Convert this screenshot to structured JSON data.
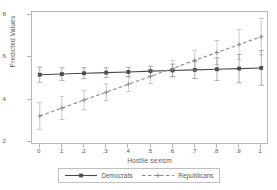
{
  "chart_data": {
    "type": "line",
    "title": "",
    "xlabel": "Hostile sexism",
    "ylabel": "Predicted Values",
    "x": [
      0,
      0.1,
      0.2,
      0.3,
      0.4,
      0.5,
      0.6,
      0.7,
      0.8,
      0.9,
      1
    ],
    "xtick_labels": [
      "0",
      ".1",
      ".2",
      ".3",
      ".4",
      ".5",
      ".6",
      ".7",
      ".8",
      ".9",
      "1"
    ],
    "ytick_labels": [
      "8",
      "6",
      "4",
      "2"
    ],
    "yticks": [
      8,
      6,
      4,
      2
    ],
    "xlim": [
      -0.035,
      1.035
    ],
    "ylim": [
      1.85,
      8.15
    ],
    "grid": false,
    "legend_position": "bottom",
    "error_bars": "95% confidence interval",
    "series": [
      {
        "name": "Democrats",
        "color": "#4a4a4a",
        "linestyle": "solid",
        "marker": "filled-square",
        "values": [
          5.18,
          5.21,
          5.25,
          5.28,
          5.31,
          5.35,
          5.38,
          5.41,
          5.44,
          5.47,
          5.5
        ],
        "ci_lower": [
          4.82,
          4.91,
          4.99,
          5.05,
          5.1,
          5.12,
          5.08,
          5.0,
          4.9,
          4.8,
          4.68
        ],
        "ci_upper": [
          5.54,
          5.51,
          5.51,
          5.51,
          5.52,
          5.58,
          5.68,
          5.82,
          5.98,
          6.14,
          6.32
        ]
      },
      {
        "name": "Republicans",
        "color": "#8a8a8a",
        "linestyle": "dashed",
        "marker": "cross",
        "values": [
          3.22,
          3.6,
          3.98,
          4.35,
          4.73,
          5.1,
          5.48,
          5.86,
          6.23,
          6.61,
          6.98
        ],
        "ci_lower": [
          2.58,
          3.06,
          3.52,
          3.96,
          4.38,
          4.76,
          5.1,
          5.4,
          5.66,
          5.9,
          6.12
        ],
        "ci_upper": [
          3.86,
          4.14,
          4.44,
          4.74,
          5.08,
          5.44,
          5.86,
          6.32,
          6.8,
          7.32,
          7.84
        ]
      }
    ],
    "legend": [
      {
        "label": "Democrats",
        "marker": "filled-square",
        "linestyle": "solid",
        "color": "#4a4a4a"
      },
      {
        "label": "Republicans",
        "marker": "cross",
        "linestyle": "dashed",
        "color": "#8a8a8a"
      }
    ]
  }
}
